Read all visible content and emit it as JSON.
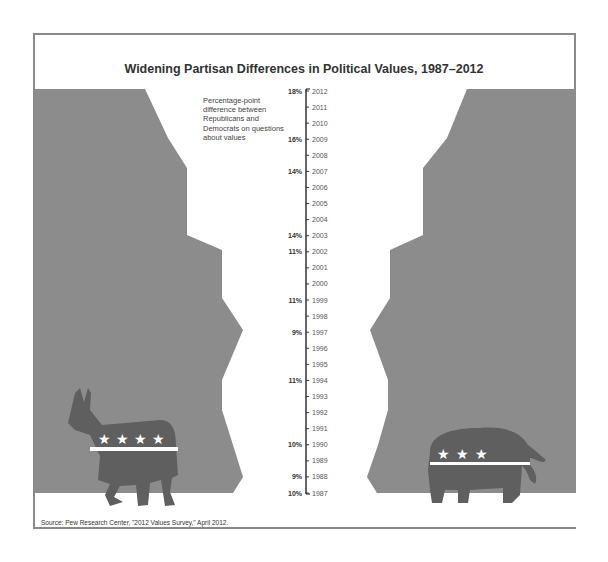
{
  "title": "Widening Partisan Differences in Political Values, 1987–2012",
  "note": "Percentage-point difference between Republicans and Democrats on questions about values",
  "source": "Source: Pew Research Center, \"2012 Values Survey,\" April 2012.",
  "colors": {
    "shape_fill": "#8c8c8c",
    "animal_fill": "#5f5f5f",
    "animal_band": "#ffffff",
    "axis": "#333333",
    "frame": "#8a8a8a"
  },
  "chart_data": {
    "type": "area",
    "title": "Widening Partisan Differences in Political Values, 1987–2012",
    "xlabel": "",
    "ylabel": "Percentage-point difference between Republicans and Democrats on questions about values",
    "orientation": "vertical-timeline, mirrored",
    "years": [
      2012,
      2011,
      2010,
      2009,
      2008,
      2007,
      2006,
      2005,
      2004,
      2003,
      2002,
      2001,
      2000,
      1999,
      1998,
      1997,
      1996,
      1995,
      1994,
      1993,
      1992,
      1991,
      1990,
      1989,
      1988,
      1987
    ],
    "labeled_points": [
      {
        "year": 2012,
        "value": 18,
        "label": "18%"
      },
      {
        "year": 2009,
        "value": 16,
        "label": "16%"
      },
      {
        "year": 2007,
        "value": 14,
        "label": "14%"
      },
      {
        "year": 2003,
        "value": 14,
        "label": "14%"
      },
      {
        "year": 2002,
        "value": 11,
        "label": "11%"
      },
      {
        "year": 1999,
        "value": 11,
        "label": "11%"
      },
      {
        "year": 1997,
        "value": 9,
        "label": "9%"
      },
      {
        "year": 1994,
        "value": 11,
        "label": "11%"
      },
      {
        "year": 1990,
        "value": 10,
        "label": "10%"
      },
      {
        "year": 1988,
        "value": 9,
        "label": "9%"
      },
      {
        "year": 1987,
        "value": 10,
        "label": "10%"
      }
    ],
    "series": [
      {
        "name": "Democrats (donkey, left)",
        "side": "left"
      },
      {
        "name": "Republicans (elephant, right)",
        "side": "right"
      }
    ],
    "grid": false,
    "legend": "none"
  }
}
